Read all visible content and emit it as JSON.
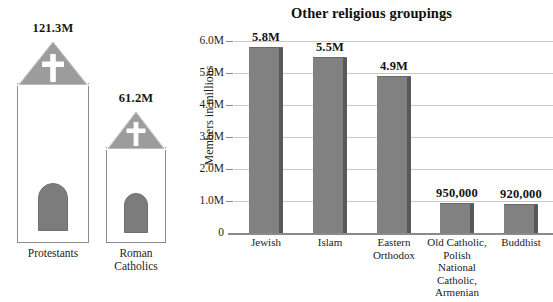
{
  "pictograms": {
    "items": [
      {
        "id": "protestants",
        "value_label": "121.3M",
        "name": "Protestants",
        "members": 121300000,
        "icon": "church-icon"
      },
      {
        "id": "roman-catholics",
        "value_label": "61.2M",
        "name": "Roman\nCatholics",
        "members": 61200000,
        "icon": "church-icon"
      }
    ]
  },
  "chart_data": {
    "type": "bar",
    "title": "Other religious groupings",
    "xlabel": "",
    "ylabel": "Members in millions",
    "ylim": [
      0,
      6000000
    ],
    "grid": true,
    "legend": false,
    "categories": [
      "Jewish",
      "Islam",
      "Eastern\nOrthodox",
      "Old Catholic,\nPolish\nNational\nCatholic,\nArmenian",
      "Buddhist"
    ],
    "values": [
      5800000,
      5500000,
      4900000,
      950000,
      920000
    ],
    "value_labels": [
      "5.8M",
      "5.5M",
      "4.9M",
      "950,000",
      "920,000"
    ],
    "ytick_values": [
      0,
      1000000,
      2000000,
      3000000,
      4000000,
      5000000,
      6000000
    ],
    "ytick_labels": [
      "0",
      "1.0M",
      "2.0M",
      "3.0M",
      "4.0M",
      "5.0M",
      "6.0M"
    ],
    "colors": {
      "bar_face": "#818181",
      "bar_side": "#585858",
      "gridline": "#c9c9c9",
      "axis": "#8a8a8a",
      "text": "#1a1a1a",
      "background": "#ffffff"
    }
  }
}
